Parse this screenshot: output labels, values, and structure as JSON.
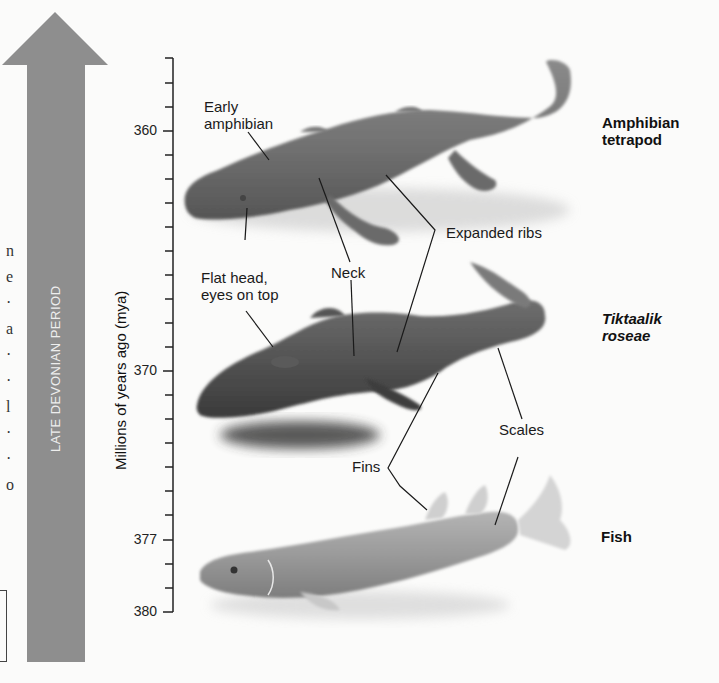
{
  "figure": {
    "period_arrow": {
      "label": "LATE DEVONIAN PERIOD",
      "color": "#8e8e8e"
    },
    "axis": {
      "title": "Millions of years ago (mya)",
      "ticks": [
        {
          "value": "360",
          "y": 131
        },
        {
          "value": "370",
          "y": 371
        },
        {
          "value": "377",
          "y": 540
        },
        {
          "value": "380",
          "y": 612
        }
      ]
    },
    "organisms": [
      {
        "name_line1": "Amphibian",
        "name_line2": "tetrapod",
        "italic": false
      },
      {
        "name_line1": "Tiktaalik",
        "name_line2": "roseae",
        "italic": true
      },
      {
        "name_line1": "Fish",
        "name_line2": "",
        "italic": false
      }
    ],
    "annotations": {
      "early_amphibian_1": "Early",
      "early_amphibian_2": "amphibian",
      "flat_head_1": "Flat head,",
      "flat_head_2": "eyes on top",
      "neck": "Neck",
      "expanded_ribs": "Expanded ribs",
      "scales": "Scales",
      "fins": "Fins"
    },
    "left_edge_fragment": [
      "n",
      "e",
      "·",
      "a",
      "·",
      "·",
      "l",
      "·",
      "·",
      "o"
    ]
  }
}
